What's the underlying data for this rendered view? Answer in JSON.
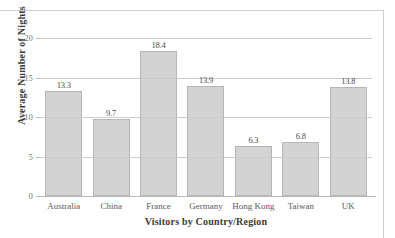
{
  "page": {
    "top_scrap_text": "",
    "bottom_caption_text": ""
  },
  "chart_data": {
    "type": "bar",
    "title": "",
    "xlabel": "Visitors by Country/Region",
    "ylabel": "Average Number of Nights",
    "categories": [
      "Australia",
      "China",
      "France",
      "Germany",
      "Hong Kong",
      "Taiwan",
      "UK"
    ],
    "values": [
      13.3,
      9.7,
      18.4,
      13.9,
      6.3,
      6.8,
      13.8
    ],
    "value_labels": [
      "13.3",
      "9.7",
      "18.4",
      "13.9",
      "6.3",
      "6.8",
      "13.8"
    ],
    "ylim": [
      0,
      20
    ],
    "ytick_values": [
      0,
      5,
      10,
      15,
      20
    ],
    "ytick_labels": [
      "0",
      "5",
      "10",
      "15",
      "20"
    ],
    "grid": "horizontal",
    "legend": "none",
    "bar_fill_color": "#d3d3d3",
    "bar_border_color": "#b6b6b6",
    "gridline_color": "#c9c9c9",
    "axis_color": "#b9b9b9",
    "text_color": "#3a3a3a"
  }
}
